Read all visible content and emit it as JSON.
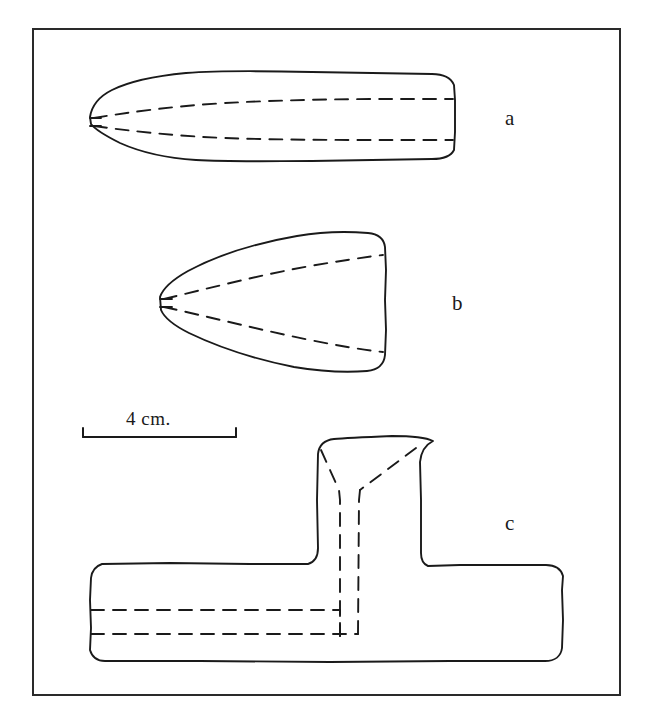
{
  "plate": {
    "title": "Archaeological artifact line drawing plate",
    "background_color": "#ffffff",
    "ink_color": "#1a1a1a",
    "width": 652,
    "height": 721,
    "border": {
      "name": "plate-border",
      "x": 33,
      "y": 29,
      "width": 587,
      "height": 666,
      "stroke_width": 2
    }
  },
  "scale_bar": {
    "label": "4 cm.",
    "x_start": 83,
    "x_end": 236,
    "y": 437,
    "tick_height": 9,
    "stroke_width": 2
  },
  "figures": [
    {
      "id": "a",
      "label": "a",
      "name": "figure-a-elongated-celt",
      "description": "Elongated tapered celt, plan view with dashed interior facet lines",
      "label_x": 505,
      "label_y": 108,
      "bounds": {
        "x": 88,
        "y": 70,
        "width": 370,
        "height": 95
      }
    },
    {
      "id": "b",
      "label": "b",
      "name": "figure-b-triangular-celt",
      "description": "Short triangular wedge celt with dashed interior facet lines",
      "label_x": 452,
      "label_y": 293,
      "bounds": {
        "x": 158,
        "y": 232,
        "width": 230,
        "height": 142
      }
    },
    {
      "id": "c",
      "label": "c",
      "name": "figure-c-t-shaped-artifact",
      "description": "T-shaped artifact: horizontal bar with vertical stem, dashed interior lines",
      "label_x": 505,
      "label_y": 513,
      "bounds": {
        "x": 88,
        "y": 435,
        "width": 476,
        "height": 228
      }
    }
  ],
  "render": {
    "solid_stroke_width": 1.9,
    "dash_stroke_width": 1.9,
    "dash_pattern": "13 9"
  }
}
